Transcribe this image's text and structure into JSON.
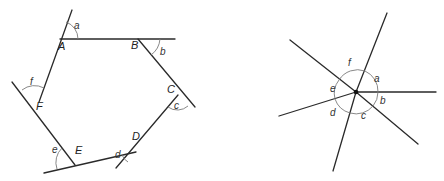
{
  "figures": {
    "hexagon": {
      "description": "Hexagon ABCDEF with sides extended to show exterior angles a–f",
      "vertices": [
        {
          "label": "A",
          "x": 60,
          "y": 39
        },
        {
          "label": "B",
          "x": 138,
          "y": 39
        },
        {
          "label": "C",
          "x": 178,
          "y": 95
        },
        {
          "label": "D",
          "x": 136,
          "y": 152
        },
        {
          "label": "E",
          "x": 75,
          "y": 165
        },
        {
          "label": "F",
          "x": 39,
          "y": 102
        }
      ],
      "exterior_angles": [
        "a",
        "b",
        "c",
        "d",
        "e",
        "f"
      ]
    },
    "point_angles": {
      "description": "Exterior angles a–f placed around a single point",
      "center": {
        "x": 356,
        "y": 92
      },
      "angle_labels": [
        "a",
        "b",
        "c",
        "d",
        "e",
        "f"
      ]
    }
  },
  "labels": {
    "A": "A",
    "B": "B",
    "C": "C",
    "D": "D",
    "E": "E",
    "F": "F",
    "a": "a",
    "b": "b",
    "c": "c",
    "d": "d",
    "e": "e",
    "f": "f"
  },
  "colors": {
    "line": "#2a2a2a",
    "arc": "#7a7a7a",
    "text": "#222222",
    "background": "#ffffff"
  }
}
